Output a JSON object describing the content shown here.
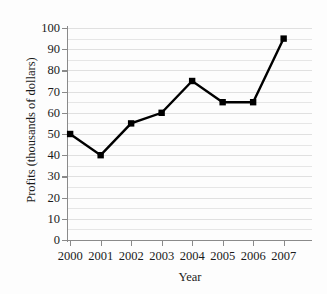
{
  "chart_data": {
    "type": "line",
    "title": "",
    "xlabel": "Year",
    "ylabel": "Profits (thousands of dollars)",
    "categories": [
      "2000",
      "2001",
      "2002",
      "2003",
      "2004",
      "2005",
      "2006",
      "2007"
    ],
    "values": [
      50,
      40,
      55,
      60,
      75,
      65,
      65,
      95
    ],
    "series": [
      {
        "name": "Profits",
        "values": [
          50,
          40,
          55,
          60,
          75,
          65,
          65,
          95
        ]
      }
    ],
    "ylim": [
      0,
      100
    ],
    "y_ticks": [
      0,
      10,
      20,
      30,
      40,
      50,
      60,
      70,
      80,
      90,
      100
    ],
    "y_tick_labels": [
      "0",
      "10",
      "20",
      "30",
      "40",
      "50",
      "60",
      "70",
      "80",
      "90",
      "100"
    ],
    "y_minor_step": 5,
    "grid": true,
    "grid_axis": "y",
    "legend": false,
    "legend_position": "none",
    "marker": "square",
    "marker_color": "#000000",
    "line_color": "#000000",
    "gridline_color": "#e6e6e6",
    "axis_color": "#8a8a8a",
    "background_color": "#fdfdfd"
  }
}
